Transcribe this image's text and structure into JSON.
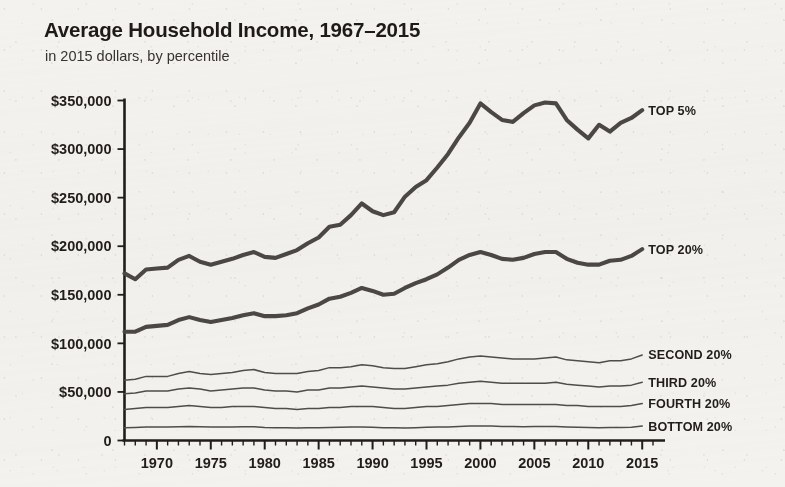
{
  "header": {
    "title": "Average Household Income, 1967–2015",
    "subtitle": "in 2015 dollars, by percentile"
  },
  "chart_data": {
    "type": "line",
    "title": "Average Household Income, 1967–2015",
    "subtitle": "in 2015 dollars, by percentile",
    "xlabel": "",
    "ylabel": "",
    "xlim": [
      1967,
      2016
    ],
    "ylim": [
      0,
      350000
    ],
    "grid": false,
    "legend_position": "right-inline-labels",
    "y_ticks": [
      0,
      50000,
      100000,
      150000,
      200000,
      250000,
      300000,
      350000
    ],
    "y_tick_labels": [
      "0",
      "$50,000",
      "$100,000",
      "$150,000",
      "$200,000",
      "$250,000",
      "$300,000",
      "$350,000"
    ],
    "x_ticks": [
      1970,
      1975,
      1980,
      1985,
      1990,
      1995,
      2000,
      2005,
      2010,
      2015
    ],
    "x_tick_labels": [
      "1970",
      "1975",
      "1980",
      "1985",
      "1990",
      "1995",
      "2000",
      "2005",
      "2010",
      "2015"
    ],
    "x_minor_tick_interval": 1,
    "x": [
      1967,
      1968,
      1969,
      1970,
      1971,
      1972,
      1973,
      1974,
      1975,
      1976,
      1977,
      1978,
      1979,
      1980,
      1981,
      1982,
      1983,
      1984,
      1985,
      1986,
      1987,
      1988,
      1989,
      1990,
      1991,
      1992,
      1993,
      1994,
      1995,
      1996,
      1997,
      1998,
      1999,
      2000,
      2001,
      2002,
      2003,
      2004,
      2005,
      2006,
      2007,
      2008,
      2009,
      2010,
      2011,
      2012,
      2013,
      2014,
      2015
    ],
    "series": [
      {
        "name": "TOP 5%",
        "style": "thick",
        "color": "#4a4744",
        "label": "TOP 5%",
        "values": [
          172000,
          166000,
          176000,
          177000,
          178000,
          186000,
          190000,
          184000,
          181000,
          184000,
          187000,
          191000,
          194000,
          189000,
          188000,
          192000,
          196000,
          203000,
          209000,
          220000,
          222000,
          232000,
          244000,
          236000,
          232000,
          235000,
          251000,
          261000,
          268000,
          281000,
          295000,
          312000,
          327000,
          347000,
          338000,
          330000,
          328000,
          337000,
          345000,
          348000,
          347000,
          330000,
          320000,
          311000,
          325000,
          318000,
          327000,
          332000,
          340000
        ]
      },
      {
        "name": "TOP 20%",
        "style": "thick",
        "color": "#4a4744",
        "label": "TOP 20%",
        "values": [
          112000,
          112000,
          117000,
          118000,
          119000,
          124000,
          127000,
          124000,
          122000,
          124000,
          126000,
          129000,
          131000,
          128000,
          128000,
          129000,
          131000,
          136000,
          140000,
          146000,
          148000,
          152000,
          157000,
          154000,
          150000,
          151000,
          157000,
          162000,
          166000,
          171000,
          178000,
          186000,
          191000,
          194000,
          191000,
          187000,
          186000,
          188000,
          192000,
          194000,
          194000,
          187000,
          183000,
          181000,
          181000,
          185000,
          186000,
          190000,
          197000
        ]
      },
      {
        "name": "SECOND 20%",
        "style": "thin",
        "color": "#4f4c49",
        "label": "SECOND 20%",
        "values": [
          62000,
          63000,
          66000,
          66000,
          66000,
          69000,
          71000,
          69000,
          68000,
          69000,
          70000,
          72000,
          73000,
          70000,
          69000,
          69000,
          69000,
          71000,
          72000,
          75000,
          75000,
          76000,
          78000,
          77000,
          75000,
          74000,
          74000,
          76000,
          78000,
          79000,
          81000,
          84000,
          86000,
          87000,
          86000,
          85000,
          84000,
          84000,
          84000,
          85000,
          86000,
          83000,
          82000,
          81000,
          80000,
          82000,
          82000,
          84000,
          88000
        ]
      },
      {
        "name": "THIRD 20%",
        "style": "thin",
        "color": "#4f4c49",
        "label": "THIRD 20%",
        "values": [
          48000,
          49000,
          51000,
          51000,
          51000,
          53000,
          54000,
          53000,
          51000,
          52000,
          53000,
          54000,
          54000,
          52000,
          51000,
          51000,
          50000,
          52000,
          52000,
          54000,
          54000,
          55000,
          56000,
          55000,
          54000,
          53000,
          53000,
          54000,
          55000,
          56000,
          57000,
          59000,
          60000,
          61000,
          60000,
          59000,
          59000,
          59000,
          59000,
          59000,
          60000,
          58000,
          57000,
          56000,
          55000,
          56000,
          56000,
          57000,
          60000
        ]
      },
      {
        "name": "FOURTH 20%",
        "style": "thin",
        "color": "#4f4c49",
        "label": "FOURTH 20%",
        "values": [
          32000,
          33000,
          34000,
          34000,
          34000,
          35000,
          36000,
          35000,
          34000,
          34000,
          35000,
          35000,
          35000,
          34000,
          33000,
          33000,
          32000,
          33000,
          33000,
          34000,
          34000,
          35000,
          35000,
          35000,
          34000,
          33000,
          33000,
          34000,
          35000,
          35000,
          36000,
          37000,
          38000,
          38000,
          38000,
          37000,
          37000,
          37000,
          37000,
          37000,
          37000,
          36000,
          36000,
          35000,
          35000,
          35000,
          35000,
          36000,
          38000
        ]
      },
      {
        "name": "BOTTOM 20%",
        "style": "thin",
        "color": "#4f4c49",
        "label": "BOTTOM 20%",
        "values": [
          13000,
          13500,
          14000,
          14000,
          13800,
          14200,
          14500,
          14200,
          13800,
          14000,
          14000,
          14200,
          14200,
          13500,
          13200,
          13000,
          12800,
          13000,
          13200,
          13500,
          13600,
          13800,
          14000,
          13700,
          13200,
          13000,
          12800,
          13200,
          13600,
          13800,
          14000,
          14500,
          14800,
          15000,
          14800,
          14500,
          14300,
          14200,
          14300,
          14400,
          14500,
          14000,
          13700,
          13400,
          13200,
          13300,
          13400,
          13700,
          14800
        ]
      }
    ]
  }
}
